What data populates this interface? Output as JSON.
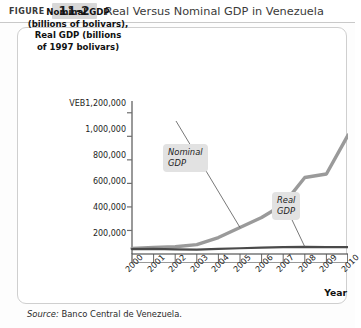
{
  "header": {
    "figure_word": "FIGURE",
    "figure_number": "11-2",
    "title": "Real Versus Nominal GDP in Venezuela"
  },
  "source_note": {
    "label": "Source:",
    "text": "Banco Central de Venezuela."
  },
  "chart_data": {
    "type": "line",
    "title": "Real Versus Nominal GDP in Venezuela",
    "xlabel": "Year",
    "ylabel": "Nominal GDP (billions of bolivars), Real GDP (billions of 1997 bolivars)",
    "ylabel_lines": [
      "Nominal GDP",
      "(billions of bolivars),",
      "Real GDP (billions",
      "of 1997 bolivars)"
    ],
    "categories": [
      "2000",
      "2001",
      "2002",
      "2003",
      "2004",
      "2005",
      "2006",
      "2007",
      "2008",
      "2009",
      "2010"
    ],
    "x": [
      2000,
      2001,
      2002,
      2003,
      2004,
      2005,
      2006,
      2007,
      2008,
      2009,
      2010
    ],
    "ylim": [
      0,
      1300000
    ],
    "xlim": [
      2000,
      2010
    ],
    "yticks": [
      200000,
      400000,
      600000,
      800000,
      1000000,
      1200000
    ],
    "ytick_labels": [
      "200,000",
      "400,000",
      "600,000",
      "800,000",
      "1,000,000",
      "VEB1,200,000"
    ],
    "currency_prefix": "VEB",
    "grid": false,
    "legend": "annotations",
    "series": [
      {
        "name": "Nominal GDP",
        "color": "#9a9a9a",
        "values": [
          48000,
          55000,
          62000,
          80000,
          140000,
          225000,
          310000,
          420000,
          650000,
          680000,
          1010000
        ]
      },
      {
        "name": "Real GDP",
        "color": "#4a4a4a",
        "values": [
          42000,
          44000,
          40000,
          37000,
          44000,
          49000,
          54000,
          58000,
          61000,
          59000,
          58000
        ]
      }
    ],
    "annotations": [
      {
        "name": "Nominal GDP",
        "lines": [
          "Nominal",
          "GDP"
        ],
        "points_to_year": 2005
      },
      {
        "name": "Real GDP",
        "lines": [
          "Real",
          "GDP"
        ],
        "points_to_year": 2008
      }
    ]
  }
}
